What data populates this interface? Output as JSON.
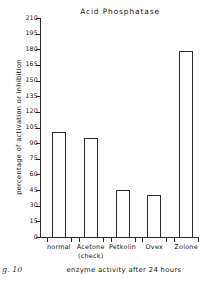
{
  "figure": {
    "caption_fragment": "g. 10"
  },
  "chart_data": {
    "type": "bar",
    "title": "Acid  Phosphatase",
    "xlabel": "enzyme activity after 24 hours",
    "ylabel": "percentage of activation or inhibition",
    "categories": [
      "normal",
      "Acetone",
      "Petkolin",
      "Ovex",
      "Zolone"
    ],
    "category_sublabels": [
      "",
      "(check)",
      "",
      "",
      ""
    ],
    "values": [
      101,
      95,
      45,
      40,
      178
    ],
    "ylim": [
      0,
      210
    ],
    "yticks": [
      0,
      15,
      30,
      45,
      60,
      75,
      90,
      105,
      120,
      135,
      150,
      165,
      180,
      195,
      210
    ],
    "grid": false,
    "legend": "none",
    "bar_facecolor": "#ffffff",
    "bar_edgecolor": "#2b2b2b",
    "axis_color": "#2a2a2a"
  }
}
